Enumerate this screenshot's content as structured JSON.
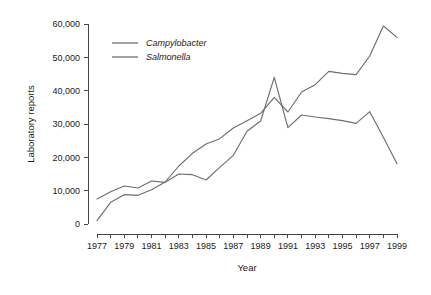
{
  "chart_data": {
    "type": "line",
    "title": "",
    "xlabel": "Year",
    "ylabel": "Laboratory reports",
    "xlim": [
      1977,
      1999
    ],
    "ylim": [
      0,
      60000
    ],
    "grid": false,
    "legend_position": "top-left",
    "x": [
      1977,
      1978,
      1979,
      1980,
      1981,
      1982,
      1983,
      1984,
      1985,
      1986,
      1987,
      1988,
      1989,
      1990,
      1991,
      1992,
      1993,
      1994,
      1995,
      1996,
      1997,
      1998,
      1999
    ],
    "y_ticks": [
      0,
      10000,
      20000,
      30000,
      40000,
      50000,
      60000
    ],
    "y_tick_labels": [
      "0",
      "10,000",
      "20,000",
      "30,000",
      "40,000",
      "50,000",
      "60,000"
    ],
    "x_ticks": [
      1977,
      1978,
      1979,
      1980,
      1981,
      1982,
      1983,
      1984,
      1985,
      1986,
      1987,
      1988,
      1989,
      1990,
      1991,
      1992,
      1993,
      1994,
      1995,
      1996,
      1997,
      1998,
      1999
    ],
    "x_tick_labels": [
      "1977",
      "",
      "1979",
      "",
      "1981",
      "",
      "1983",
      "",
      "1985",
      "",
      "1987",
      "",
      "1989",
      "",
      "1991",
      "",
      "1993",
      "",
      "1995",
      "",
      "1997",
      "",
      "1999"
    ],
    "series": [
      {
        "name": "Campylobacter",
        "color": "#6e6e6e",
        "values": [
          1000,
          6500,
          8800,
          8600,
          10300,
          12600,
          17400,
          21200,
          24000,
          25600,
          28800,
          31000,
          33200,
          38000,
          33600,
          39600,
          41800,
          45800,
          45200,
          44800,
          50400,
          59400,
          56000
        ]
      },
      {
        "name": "Salmonella",
        "color": "#6e6e6e",
        "values": [
          7500,
          9700,
          11400,
          10800,
          12900,
          12500,
          15000,
          14800,
          13200,
          17000,
          20600,
          27800,
          30900,
          44000,
          28900,
          32700,
          32100,
          31600,
          31000,
          30200,
          33700,
          26000,
          18100
        ]
      }
    ]
  },
  "legend": {
    "items": [
      {
        "label": "Campylobacter"
      },
      {
        "label": "Salmonella"
      }
    ]
  },
  "axes": {
    "x_title": "Year",
    "y_title": "Laboratory reports"
  }
}
